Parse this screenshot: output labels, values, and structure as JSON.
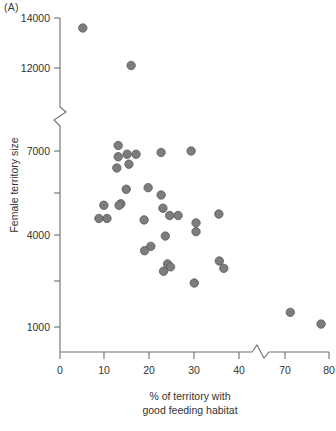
{
  "figure": {
    "panel_label": "(A)",
    "background_color": "#ffffff",
    "axis_color": "#6e6e6e",
    "point_fill_color": "#7d7d7d",
    "point_stroke_color": "#595959"
  },
  "chart_data": {
    "type": "scatter",
    "title": "",
    "subtitle": "",
    "xlabel": "% of territory with good feeding habitat",
    "xlabel_lines": [
      "% of territory with",
      "good feeding habitat"
    ],
    "ylabel": "Female territory size",
    "xlim": [
      0,
      80
    ],
    "ylim": [
      0,
      14000
    ],
    "grid": false,
    "legend": null,
    "legend_position": "none",
    "x_ticks": [
      0,
      10,
      20,
      30,
      40,
      70,
      80
    ],
    "x_tick_labels": [
      "0",
      "10",
      "20",
      "30",
      "40",
      "70",
      "80"
    ],
    "x_axis_break": {
      "present": true,
      "between": [
        40,
        70
      ],
      "at_value": 44
    },
    "y_ticks": [
      1000,
      2500,
      4000,
      5500,
      7000,
      12000,
      14000
    ],
    "y_tick_labels": [
      "1000",
      "",
      "4000",
      "",
      "7000",
      "12000",
      "14000"
    ],
    "y_axis_break": {
      "present": true,
      "between": [
        7000,
        12000
      ],
      "at_value": 9500
    },
    "marker": "circle",
    "n_points": 38,
    "annotations": [
      "(A)"
    ],
    "points": [
      {
        "x": 5.1,
        "y": 13600
      },
      {
        "x": 15.9,
        "y": 12100
      },
      {
        "x": 13.0,
        "y": 8900
      },
      {
        "x": 13.0,
        "y": 8450
      },
      {
        "x": 15.0,
        "y": 8550
      },
      {
        "x": 17.0,
        "y": 8550
      },
      {
        "x": 12.7,
        "y": 8000
      },
      {
        "x": 14.8,
        "y": 7150
      },
      {
        "x": 15.4,
        "y": 6550
      },
      {
        "x": 22.6,
        "y": 6950
      },
      {
        "x": 29.3,
        "y": 7000
      },
      {
        "x": 19.7,
        "y": 5750
      },
      {
        "x": 22.6,
        "y": 5500
      },
      {
        "x": 13.6,
        "y": 5200
      },
      {
        "x": 9.8,
        "y": 5150
      },
      {
        "x": 13.2,
        "y": 5150
      },
      {
        "x": 23.0,
        "y": 5050
      },
      {
        "x": 24.5,
        "y": 4800
      },
      {
        "x": 26.4,
        "y": 4800
      },
      {
        "x": 18.8,
        "y": 4650
      },
      {
        "x": 8.7,
        "y": 4700
      },
      {
        "x": 10.5,
        "y": 4700
      },
      {
        "x": 30.4,
        "y": 4550
      },
      {
        "x": 35.5,
        "y": 4850
      },
      {
        "x": 30.4,
        "y": 4250
      },
      {
        "x": 42.8,
        "y": 4100
      },
      {
        "x": 20.3,
        "y": 3750
      },
      {
        "x": 18.9,
        "y": 3600
      },
      {
        "x": 35.6,
        "y": 3250
      },
      {
        "x": 43.3,
        "y": 3150
      },
      {
        "x": 24.7,
        "y": 3050
      },
      {
        "x": 36.6,
        "y": 3000
      },
      {
        "x": 42.4,
        "y": 2900
      },
      {
        "x": 30.0,
        "y": 2500
      },
      {
        "x": 71.2,
        "y": 1500
      },
      {
        "x": 78.2,
        "y": 1100
      }
    ]
  }
}
